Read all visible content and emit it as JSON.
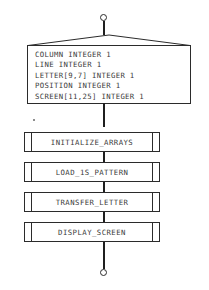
{
  "diagram": {
    "type": "flowchart",
    "line_color": "#2b2b2b",
    "text_color": "#3a3a3a",
    "background": "#ffffff"
  },
  "start_terminator": {
    "shape": "circle",
    "label": ""
  },
  "end_terminator": {
    "shape": "circle",
    "label": ""
  },
  "declaration_block": {
    "shape": "declaration-roof-box",
    "lines": [
      "COLUMN INTEGER 1",
      "LINE INTEGER 1",
      "LETTER[9,7] INTEGER 1",
      "POSITION INTEGER 1",
      "SCREEN[11,25] INTEGER 1"
    ]
  },
  "process_steps": [
    {
      "label": "INITIALIZE_ARRAYS",
      "shape": "predefined-process"
    },
    {
      "label": "LOAD_1S_PATTERN",
      "shape": "predefined-process"
    },
    {
      "label": "TRANSFER_LETTER",
      "shape": "predefined-process"
    },
    {
      "label": "DISPLAY_SCREEN",
      "shape": "predefined-process"
    }
  ]
}
